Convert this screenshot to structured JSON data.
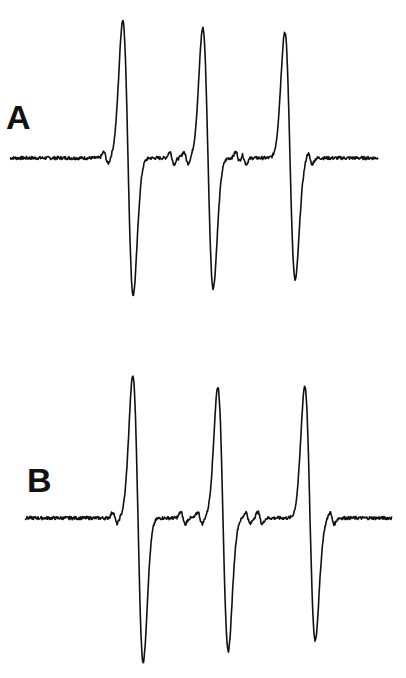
{
  "chart_data": {
    "type": "line",
    "title": "",
    "xlabel": "",
    "ylabel": "",
    "grid": false,
    "legend": "none",
    "panels": [
      {
        "label": "A",
        "baseline_y_px": 158,
        "x_range_px": [
          10,
          378
        ],
        "lines": [
          {
            "center_x_px": 128,
            "peak_top_y_px": 20,
            "trough_bottom_y_px": 295
          },
          {
            "center_x_px": 208,
            "peak_top_y_px": 28,
            "trough_bottom_y_px": 288
          },
          {
            "center_x_px": 290,
            "peak_top_y_px": 32,
            "trough_bottom_y_px": 280
          }
        ],
        "satellites_x_px": [
          106,
          172,
          186,
          238,
          244,
          310
        ]
      },
      {
        "label": "B",
        "baseline_y_px": 518,
        "x_range_px": [
          25,
          392
        ],
        "lines": [
          {
            "center_x_px": 138,
            "peak_top_y_px": 376,
            "trough_bottom_y_px": 662
          },
          {
            "center_x_px": 223,
            "peak_top_y_px": 387,
            "trough_bottom_y_px": 651
          },
          {
            "center_x_px": 310,
            "peak_top_y_px": 386,
            "trough_bottom_y_px": 640
          }
        ],
        "satellites_x_px": [
          115,
          183,
          200,
          248,
          260,
          332
        ]
      }
    ]
  },
  "panels": {
    "a": {
      "label": "A"
    },
    "b": {
      "label": "B"
    }
  },
  "colors": {
    "trace": "#111111",
    "background": "#ffffff"
  }
}
